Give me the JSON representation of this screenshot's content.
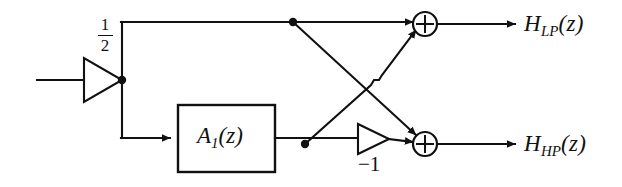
{
  "diagram": {
    "background_color": "#ffffff",
    "line_color": "#111111",
    "blocks": [
      {
        "id": "allpass",
        "label_main": "A",
        "label_sub": "1",
        "label_tail": "(z)",
        "shape": "rectangle"
      }
    ],
    "gains": [
      {
        "id": "half-gain",
        "numerator": "1",
        "denominator": "2",
        "shape": "triangle"
      },
      {
        "id": "neg-one-gain",
        "label": "−1",
        "shape": "triangle"
      }
    ],
    "adders": [
      {
        "id": "adder-top",
        "symbol": "+"
      },
      {
        "id": "adder-bottom",
        "symbol": "+"
      }
    ],
    "outputs": [
      {
        "id": "output-lp",
        "main": "H",
        "sub": "LP",
        "tail": "(z)"
      },
      {
        "id": "output-hp",
        "main": "H",
        "sub": "HP",
        "tail": "(z)"
      }
    ]
  }
}
